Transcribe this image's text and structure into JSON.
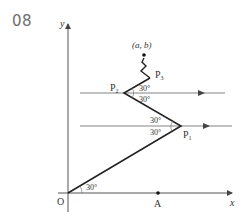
{
  "problem_number": "08",
  "labels": {
    "y_axis": "y",
    "x_axis": "x",
    "origin": "O",
    "point_a": "A",
    "target": "(a, b)",
    "p1": "P",
    "p1_sub": "1",
    "p2": "P",
    "p2_sub": "2",
    "p3": "P",
    "p3_sub": "3",
    "angle_origin": "30°",
    "angle_p1_upper": "30°",
    "angle_p1_lower": "30°",
    "angle_p2_upper": "30°",
    "angle_p2_lower": "30°"
  },
  "colors": {
    "line": "#222222",
    "axis": "#555555",
    "text": "#333333"
  }
}
